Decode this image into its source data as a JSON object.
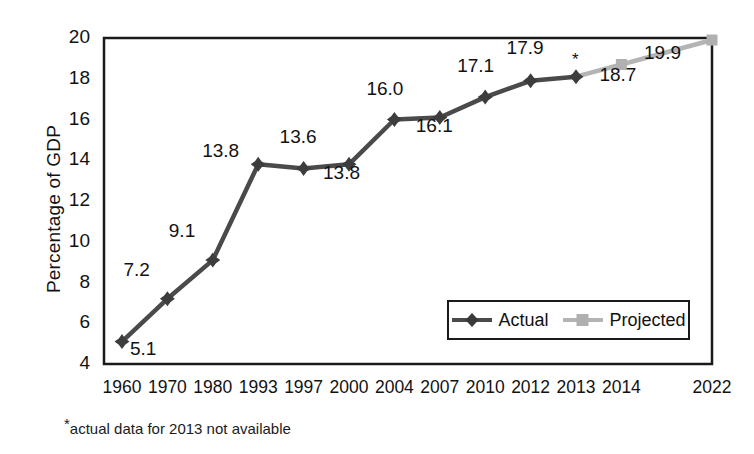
{
  "chart_data": {
    "type": "line",
    "title": "",
    "xlabel": "",
    "ylabel": "Percentage of GDP",
    "ylim": [
      4,
      20
    ],
    "ytick_values": [
      4,
      6,
      8,
      10,
      12,
      14,
      16,
      18,
      20
    ],
    "ytick_labels": [
      "4",
      "6",
      "8",
      "10",
      "12",
      "14",
      "16",
      "18",
      "20"
    ],
    "grid": false,
    "legend_position": "inside-bottom-right",
    "categories": [
      "1960",
      "1970",
      "1980",
      "1993",
      "1997",
      "2000",
      "2004",
      "2007",
      "2010",
      "2012",
      "2013",
      "2014",
      "2022"
    ],
    "series": [
      {
        "name": "Actual",
        "color": "#4a4a4a",
        "marker": "diamond",
        "values": [
          5.1,
          7.2,
          9.1,
          13.8,
          13.6,
          13.8,
          16.0,
          16.1,
          17.1,
          17.9,
          18.1,
          null,
          null
        ],
        "point_labels": [
          "5.1",
          "7.2",
          "9.1",
          "13.8",
          "13.6",
          "13.8",
          "16.0",
          "16.1",
          "17.1",
          "17.9",
          "",
          "",
          ""
        ]
      },
      {
        "name": "Projected",
        "color": "#b4b4b4",
        "marker": "square",
        "values": [
          null,
          null,
          null,
          null,
          null,
          null,
          null,
          null,
          null,
          null,
          18.1,
          18.7,
          19.9
        ],
        "point_labels": [
          "",
          "",
          "",
          "",
          "",
          "",
          "",
          "",
          "",
          "",
          "",
          "18.7",
          "19.9"
        ]
      }
    ],
    "annotations": [
      {
        "name": "asterisk-2013",
        "text": "*",
        "at_category": "2013",
        "note": "actual data for 2013 not available"
      }
    ]
  },
  "axis": {
    "y_title": "Percentage of GDP"
  },
  "ytick_labels": [
    "20",
    "18",
    "16",
    "14",
    "12",
    "10",
    "8",
    "6",
    "4"
  ],
  "xtick_labels": [
    "1960",
    "1970",
    "1980",
    "1993",
    "1997",
    "2000",
    "2004",
    "2007",
    "2010",
    "2012",
    "2013",
    "2014",
    "2022"
  ],
  "data_labels": [
    "5.1",
    "7.2",
    "9.1",
    "13.8",
    "13.6",
    "13.8",
    "16.0",
    "16.1",
    "17.1",
    "17.9",
    "18.7",
    "19.9"
  ],
  "legend": {
    "items": [
      {
        "label": "Actual",
        "color": "#4a4a4a",
        "marker": "diamond"
      },
      {
        "label": "Projected",
        "color": "#b4b4b4",
        "marker": "square"
      }
    ]
  },
  "asterisk": "*",
  "footnote": {
    "star": "*",
    "text": "actual data for 2013 not available"
  }
}
